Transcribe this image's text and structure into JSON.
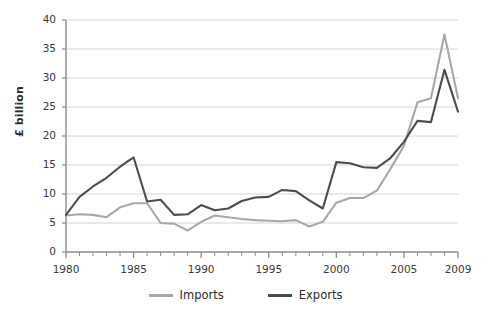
{
  "chart_data": {
    "type": "line",
    "title": "",
    "subtitle": "",
    "xlabel": "",
    "ylabel": "£ billion",
    "xlim": [
      1980,
      2009
    ],
    "ylim": [
      0,
      40
    ],
    "grid": true,
    "legend_position": "bottom",
    "x": [
      1980,
      1981,
      1982,
      1983,
      1984,
      1985,
      1986,
      1987,
      1988,
      1989,
      1990,
      1991,
      1992,
      1993,
      1994,
      1995,
      1996,
      1997,
      1998,
      1999,
      2000,
      2001,
      2002,
      2003,
      2004,
      2005,
      2006,
      2007,
      2008,
      2009
    ],
    "ytick_labels": [
      "0",
      "5",
      "10",
      "15",
      "20",
      "25",
      "30",
      "35",
      "40"
    ],
    "ytick_values": [
      0,
      5,
      10,
      15,
      20,
      25,
      30,
      35,
      40
    ],
    "xtick_labels": [
      "1980",
      "1985",
      "1990",
      "1995",
      "2000",
      "2005",
      "2009"
    ],
    "xtick_values": [
      1980,
      1985,
      1990,
      1995,
      2000,
      2005,
      2009
    ],
    "series": [
      {
        "name": "Imports",
        "color": "#a8a8a8",
        "values": [
          6.3,
          6.5,
          6.4,
          6.0,
          7.7,
          8.4,
          8.4,
          5.0,
          4.9,
          3.7,
          5.2,
          6.3,
          6.0,
          5.7,
          5.5,
          5.4,
          5.3,
          5.5,
          4.4,
          5.2,
          8.5,
          9.3,
          9.3,
          10.6,
          14.3,
          18.3,
          25.8,
          26.5,
          37.5,
          26.5
        ]
      },
      {
        "name": "Exports",
        "color": "#4d4d4d",
        "values": [
          6.4,
          9.5,
          11.3,
          12.8,
          14.7,
          16.3,
          8.7,
          9.0,
          6.4,
          6.5,
          8.1,
          7.2,
          7.5,
          8.8,
          9.4,
          9.5,
          10.7,
          10.5,
          8.9,
          7.5,
          15.5,
          15.3,
          14.6,
          14.5,
          16.2,
          19.0,
          22.6,
          22.4,
          31.4,
          24.2
        ]
      }
    ]
  },
  "legend": {
    "items": [
      {
        "label": "Imports",
        "color": "#a8a8a8"
      },
      {
        "label": "Exports",
        "color": "#4d4d4d"
      }
    ]
  },
  "colors": {
    "imports": "#a8a8a8",
    "exports": "#4d4d4d",
    "grid": "#c9c9c9",
    "axis": "#8c8c8c",
    "text": "#333333"
  }
}
